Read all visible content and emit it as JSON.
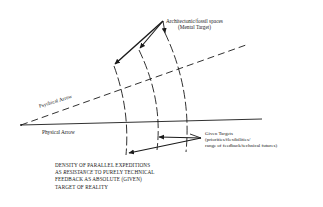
{
  "diagram": {
    "top_label": {
      "line1": "Architectonic/fossil spaces",
      "line2": "(Mental Target)"
    },
    "psychical_arrow_label": "Psychical Arrow",
    "physical_arrow_label": "Physical Arrow",
    "given_targets": {
      "line1": "Given Targets",
      "line2": "(priorities/flexibilities/",
      "line3": "range of feedback/technical futures)"
    },
    "caption": {
      "line1": "DENSITY OF PARALLEL EXPEDITIONS",
      "line2_prefix": "AS ",
      "line2_emphasis": "RESISTANCE",
      "line2_suffix": " TO PURELY TECHNICAL",
      "line3": "FEEDBACK AS ABSOLUTE (GIVEN)",
      "line4": "TARGET OF REALITY"
    },
    "colors": {
      "ink": "#1a1a1a",
      "background": "#ffffff"
    }
  }
}
